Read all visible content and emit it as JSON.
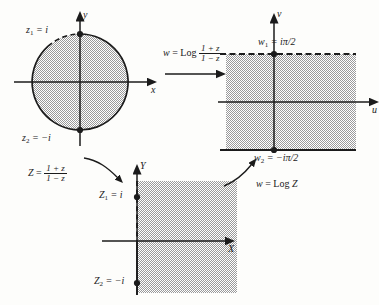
{
  "figure": {
    "accent_color": "#1b1b1b",
    "shade_color": "#b9b9b9"
  },
  "z_plane": {
    "name": "z-plane",
    "axis_x_label": "x",
    "axis_y_label": "y",
    "point_top_label": "z",
    "point_top_sub": "1",
    "point_top_value": " = i",
    "point_bottom_label": "z",
    "point_bottom_sub": "2",
    "point_bottom_value": " = −i",
    "region": "unit disk"
  },
  "w_plane": {
    "name": "w-plane",
    "axis_x_label": "u",
    "axis_y_label": "v",
    "point_top_label": "w",
    "point_top_sub": "1",
    "point_top_value": " = iπ/2",
    "point_bottom_label": "w",
    "point_bottom_sub": "2",
    "point_bottom_value": " = −iπ/2",
    "region": "horizontal strip"
  },
  "Z_plane": {
    "name": "Z-plane",
    "axis_x_label": "X",
    "axis_y_label": "Y",
    "point_top_label": "Z",
    "point_top_sub": "1",
    "point_top_value": " = i",
    "point_bottom_label": "Z",
    "point_bottom_sub": "2",
    "point_bottom_value": " = −i",
    "region": "right half plane"
  },
  "maps": {
    "top": {
      "name": "log-mobius-map",
      "lhs": "w",
      "eq": " = ",
      "op": "Log",
      "num": "1 + z",
      "den": "1 − z"
    },
    "left": {
      "name": "mobius-map",
      "lhs": "Z",
      "eq": " = ",
      "num": "1 + z",
      "den": "1 − z"
    },
    "right": {
      "name": "log-map",
      "lhs": "w",
      "eq": " = ",
      "op": "Log",
      "arg": "Z"
    }
  }
}
